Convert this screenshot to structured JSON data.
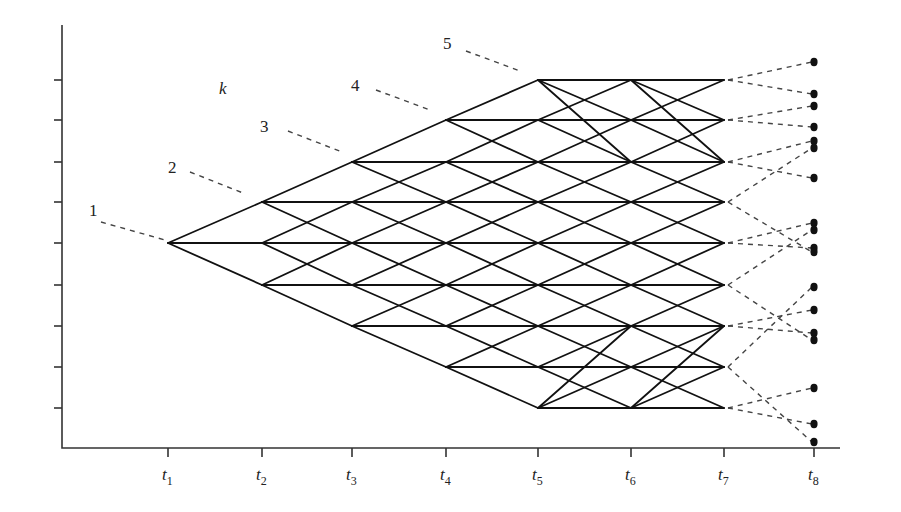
{
  "figure": {
    "type": "recombining lattice / tree diagram",
    "variable_label": "k",
    "time_labels": [
      "t",
      "t",
      "t",
      "t",
      "t",
      "t",
      "t",
      "t"
    ],
    "time_subscripts": [
      "1",
      "2",
      "3",
      "4",
      "5",
      "6",
      "7",
      "8"
    ],
    "stage_labels": [
      "1",
      "2",
      "3",
      "4",
      "5"
    ]
  },
  "layout": {
    "axis": {
      "x0": 62,
      "y_top": 25,
      "y0": 448,
      "x_end": 840
    },
    "time_x": [
      168,
      262,
      352,
      446,
      538,
      631,
      724,
      814
    ],
    "level_y": [
      80,
      120,
      162,
      202,
      243,
      285,
      326,
      367,
      408
    ],
    "stage_label_pos": [
      {
        "x": 89,
        "y": 216,
        "lx1": 101,
        "ly1": 222,
        "lx2": 165,
        "ly2": 240
      },
      {
        "x": 168,
        "y": 173,
        "lx1": 190,
        "ly1": 172,
        "lx2": 243,
        "ly2": 193
      },
      {
        "x": 260,
        "y": 132,
        "lx1": 288,
        "ly1": 131,
        "lx2": 342,
        "ly2": 152
      },
      {
        "x": 351,
        "y": 91,
        "lx1": 376,
        "ly1": 90,
        "lx2": 430,
        "ly2": 110
      },
      {
        "x": 443,
        "y": 49,
        "lx1": 466,
        "ly1": 51,
        "lx2": 520,
        "ly2": 71
      }
    ],
    "k_pos": {
      "x": 219,
      "y": 94
    }
  },
  "lattice": {
    "nodes_per_time": [
      [
        4
      ],
      [
        3,
        4,
        5
      ],
      [
        2,
        3,
        4,
        5,
        6
      ],
      [
        1,
        2,
        3,
        4,
        5,
        6,
        7
      ],
      [
        0,
        1,
        2,
        3,
        4,
        5,
        6,
        7,
        8
      ],
      [
        0,
        1,
        2,
        3,
        4,
        5,
        6,
        7,
        8
      ],
      [
        0,
        1,
        2,
        3,
        4,
        5,
        6,
        7,
        8
      ]
    ],
    "extra_edges": [
      {
        "from": [
          4,
          0
        ],
        "to": [
          5,
          2
        ]
      },
      {
        "from": [
          5,
          0
        ],
        "to": [
          6,
          2
        ]
      },
      {
        "from": [
          4,
          8
        ],
        "to": [
          5,
          6
        ]
      },
      {
        "from": [
          5,
          8
        ],
        "to": [
          6,
          6
        ]
      }
    ]
  },
  "terminal": {
    "dots_y": [
      62,
      94,
      106,
      127,
      141,
      148,
      178,
      223,
      230,
      248,
      252,
      287,
      310,
      333,
      340,
      388,
      424,
      442
    ],
    "dashed_links": [
      [
        80,
        62
      ],
      [
        80,
        94
      ],
      [
        120,
        106
      ],
      [
        120,
        127
      ],
      [
        162,
        141
      ],
      [
        162,
        178
      ],
      [
        202,
        148
      ],
      [
        202,
        252
      ],
      [
        243,
        223
      ],
      [
        243,
        248
      ],
      [
        285,
        230
      ],
      [
        285,
        340
      ],
      [
        326,
        310
      ],
      [
        326,
        333
      ],
      [
        367,
        287
      ],
      [
        367,
        442
      ],
      [
        408,
        388
      ],
      [
        408,
        424
      ]
    ]
  }
}
